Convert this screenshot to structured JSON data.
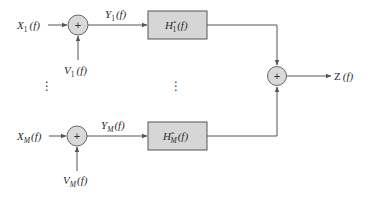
{
  "diagram": {
    "type": "block-diagram",
    "colors": {
      "line": "#555555",
      "block_fill": "#d6d6d6",
      "block_stroke": "#555555",
      "junction_fill": "#d9d9d9",
      "text": "#2a2a2a"
    },
    "branches": [
      {
        "id": "1",
        "input": {
          "base": "X",
          "sub": "1",
          "arg": "(f)"
        },
        "noise": {
          "base": "V",
          "sub": "1",
          "arg": "(f)"
        },
        "intermediate": {
          "base": "Y",
          "sub": "1",
          "arg": "(f)"
        },
        "filter": {
          "base": "H",
          "sup": "*",
          "sub": "1",
          "arg": "(f)"
        },
        "junction_symbol": "+"
      },
      {
        "id": "M",
        "input": {
          "base": "X",
          "sub": "M",
          "arg": "(f)"
        },
        "noise": {
          "base": "V",
          "sub": "M",
          "arg": "(f)"
        },
        "intermediate": {
          "base": "Y",
          "sub": "M",
          "arg": "(f)"
        },
        "filter": {
          "base": "H",
          "sup": "*",
          "sub": "M",
          "arg": "(f)"
        },
        "junction_symbol": "+"
      }
    ],
    "ellipsis": "⋮",
    "sum_junction": {
      "symbol": "+"
    },
    "output": {
      "base": "Z",
      "arg": "(f)"
    }
  }
}
